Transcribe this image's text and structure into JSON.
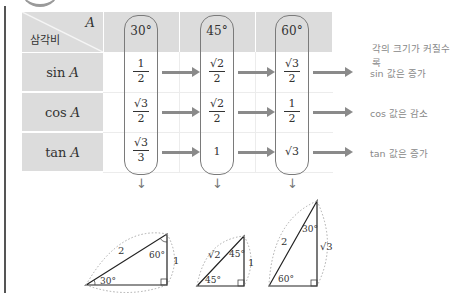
{
  "table": {
    "corner": {
      "top_label": "A",
      "bottom_label": "삼각비"
    },
    "angles": [
      "30°",
      "45°",
      "60°"
    ],
    "rows": [
      {
        "label": "sin",
        "var": "A",
        "values": [
          {
            "num": "1",
            "den": "2"
          },
          {
            "num": "√2",
            "den": "2"
          },
          {
            "num": "√3",
            "den": "2"
          }
        ],
        "note": "sin 값은 증가"
      },
      {
        "label": "cos",
        "var": "A",
        "values": [
          {
            "num": "√3",
            "den": "2"
          },
          {
            "num": "√2",
            "den": "2"
          },
          {
            "num": "1",
            "den": "2"
          }
        ],
        "note": "cos 값은 감소"
      },
      {
        "label": "tan",
        "var": "A",
        "values": [
          {
            "num": "√3",
            "den": "3"
          },
          {
            "plain": "1"
          },
          {
            "plain": "√3"
          }
        ],
        "note": "tan 값은 증가"
      }
    ],
    "header_note": "각의 크기가 커질수록"
  },
  "triangles": [
    {
      "angle_label": "30°",
      "top_angle": "60°",
      "hyp": "2",
      "vertical": "1",
      "base": "√3"
    },
    {
      "angle_label": "45°",
      "top_angle": "45°",
      "hyp": "√2",
      "vertical": "1",
      "base": "1"
    },
    {
      "angle_label": "60°",
      "top_angle": "30°",
      "hyp": "2",
      "vertical": "√3",
      "base": "1"
    }
  ],
  "colors": {
    "header_bg": "#dcdcdc",
    "arrow": "#8a8a8a",
    "note_text": "#888888"
  }
}
